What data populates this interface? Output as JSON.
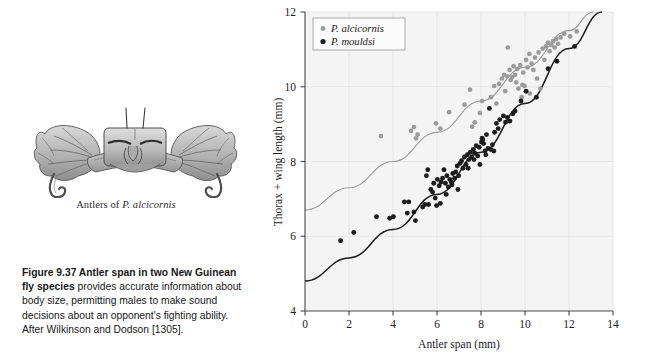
{
  "figure": {
    "caption_bold": "Figure 9.37    Antler span in two New Guinean fly species",
    "caption_rest": " provides accurate information about body size, permitting males to make sound decisions about an opponent's fighting ability. After Wilkinson and Dodson [1305]."
  },
  "illustration": {
    "name": "antler-head-drawing",
    "caption_prefix": "Antlers of ",
    "caption_species": "P. alcicornis"
  },
  "chart_data": {
    "type": "scatter",
    "title": "",
    "xlabel": "Antler span (mm)",
    "ylabel": "Thorax + wing length (mm)",
    "xlim": [
      0,
      14
    ],
    "ylim": [
      4,
      12
    ],
    "xticks": [
      0,
      2,
      4,
      6,
      8,
      10,
      12,
      14
    ],
    "yticks": [
      4,
      6,
      8,
      10,
      12
    ],
    "grid": true,
    "legend_position": "top-left",
    "colors": {
      "alcicornis": "#9b9b9b",
      "mouldsi": "#1d1d1d",
      "plot_background": "#f4f4f4",
      "gridline": "#e2e2e2",
      "axis": "#4a4a4a"
    },
    "series": [
      {
        "name": "P. alcicornis",
        "marker": "circle",
        "color": "#9b9b9b",
        "points": [
          [
            3.45,
            8.68
          ],
          [
            4.82,
            8.82
          ],
          [
            4.95,
            8.92
          ],
          [
            5.05,
            8.62
          ],
          [
            5.12,
            8.72
          ],
          [
            5.95,
            9.02
          ],
          [
            6.15,
            8.88
          ],
          [
            6.55,
            9.32
          ],
          [
            7.25,
            9.52
          ],
          [
            7.6,
            8.93
          ],
          [
            7.72,
            9.05
          ],
          [
            7.95,
            9.3
          ],
          [
            7.5,
            9.92
          ],
          [
            8.05,
            9.62
          ],
          [
            8.45,
            9.72
          ],
          [
            8.6,
            10.02
          ],
          [
            8.95,
            10.22
          ],
          [
            8.7,
            9.55
          ],
          [
            9.05,
            10.32
          ],
          [
            9.1,
            9.88
          ],
          [
            9.18,
            10.28
          ],
          [
            9.22,
            11.05
          ],
          [
            9.3,
            10.45
          ],
          [
            9.35,
            10.18
          ],
          [
            9.42,
            10.26
          ],
          [
            9.48,
            10.55
          ],
          [
            9.55,
            10.32
          ],
          [
            9.6,
            10.12
          ],
          [
            9.65,
            10.48
          ],
          [
            9.7,
            9.95
          ],
          [
            9.78,
            10.58
          ],
          [
            9.85,
            9.72
          ],
          [
            9.92,
            10.38
          ],
          [
            9.98,
            10.02
          ],
          [
            10.05,
            10.72
          ],
          [
            10.12,
            10.52
          ],
          [
            10.2,
            10.88
          ],
          [
            10.3,
            10.62
          ],
          [
            10.38,
            10.45
          ],
          [
            10.45,
            10.78
          ],
          [
            10.55,
            10.22
          ],
          [
            10.62,
            10.92
          ],
          [
            10.7,
            9.95
          ],
          [
            10.8,
            11.02
          ],
          [
            10.88,
            10.72
          ],
          [
            10.95,
            11.08
          ],
          [
            11.05,
            11.18
          ],
          [
            11.12,
            10.95
          ],
          [
            11.2,
            11.12
          ],
          [
            11.28,
            11.22
          ],
          [
            11.35,
            11.05
          ],
          [
            11.42,
            11.28
          ],
          [
            11.5,
            11.15
          ],
          [
            11.62,
            11.32
          ],
          [
            11.78,
            11.42
          ],
          [
            12.05,
            11.35
          ],
          [
            12.35,
            11.48
          ],
          [
            10.22,
            9.82
          ],
          [
            9.88,
            10.05
          ],
          [
            8.82,
            10.08
          ]
        ]
      },
      {
        "name": "P. mouldsi",
        "marker": "circle",
        "color": "#1d1d1d",
        "points": [
          [
            1.62,
            5.88
          ],
          [
            2.22,
            6.1
          ],
          [
            3.25,
            6.52
          ],
          [
            3.85,
            6.48
          ],
          [
            4.02,
            6.52
          ],
          [
            4.52,
            6.92
          ],
          [
            4.65,
            6.62
          ],
          [
            4.95,
            6.65
          ],
          [
            5.02,
            6.42
          ],
          [
            5.45,
            6.85
          ],
          [
            5.52,
            7.62
          ],
          [
            5.58,
            7.78
          ],
          [
            5.72,
            7.25
          ],
          [
            5.8,
            7.18
          ],
          [
            5.85,
            7.42
          ],
          [
            5.92,
            7.02
          ],
          [
            5.98,
            6.82
          ],
          [
            6.02,
            7.52
          ],
          [
            6.1,
            7.35
          ],
          [
            6.18,
            7.45
          ],
          [
            6.25,
            7.55
          ],
          [
            6.32,
            7.78
          ],
          [
            6.38,
            7.42
          ],
          [
            6.45,
            7.62
          ],
          [
            6.52,
            7.32
          ],
          [
            6.58,
            7.52
          ],
          [
            6.65,
            7.45
          ],
          [
            6.72,
            7.68
          ],
          [
            6.8,
            7.55
          ],
          [
            6.85,
            7.72
          ],
          [
            6.92,
            7.88
          ],
          [
            6.98,
            7.62
          ],
          [
            7.05,
            7.95
          ],
          [
            7.12,
            8.02
          ],
          [
            7.18,
            7.82
          ],
          [
            7.25,
            8.12
          ],
          [
            7.32,
            7.92
          ],
          [
            7.38,
            8.18
          ],
          [
            7.45,
            8.05
          ],
          [
            7.52,
            8.25
          ],
          [
            7.58,
            8.12
          ],
          [
            7.65,
            8.32
          ],
          [
            7.72,
            8.22
          ],
          [
            7.78,
            8.42
          ],
          [
            7.85,
            8.15
          ],
          [
            7.92,
            8.38
          ],
          [
            7.95,
            7.92
          ],
          [
            8.02,
            8.52
          ],
          [
            8.05,
            8.62
          ],
          [
            8.08,
            8.58
          ],
          [
            8.12,
            8.48
          ],
          [
            8.18,
            8.28
          ],
          [
            8.25,
            8.72
          ],
          [
            8.32,
            8.35
          ],
          [
            8.38,
            9.42
          ],
          [
            8.45,
            8.32
          ],
          [
            8.52,
            8.45
          ],
          [
            8.58,
            8.28
          ],
          [
            8.62,
            8.78
          ],
          [
            8.7,
            9.02
          ],
          [
            8.78,
            8.88
          ],
          [
            8.85,
            9.12
          ],
          [
            9.02,
            9.22
          ],
          [
            9.12,
            9.05
          ],
          [
            9.2,
            9.18
          ],
          [
            9.32,
            9.08
          ],
          [
            9.45,
            9.28
          ],
          [
            9.55,
            9.35
          ],
          [
            6.15,
            6.88
          ],
          [
            5.62,
            6.85
          ],
          [
            4.72,
            6.92
          ],
          [
            7.42,
            7.82
          ],
          [
            6.95,
            7.25
          ],
          [
            7.68,
            8.05
          ],
          [
            8.22,
            8.18
          ],
          [
            9.82,
            9.62
          ],
          [
            10.05,
            9.88
          ],
          [
            10.52,
            9.72
          ],
          [
            11.05,
            10.48
          ],
          [
            11.45,
            10.68
          ],
          [
            12.25,
            11.08
          ],
          [
            6.42,
            7.12
          ],
          [
            6.68,
            7.38
          ],
          [
            5.35,
            6.78
          ]
        ]
      }
    ],
    "fit_curves": [
      {
        "name": "P. alcicornis fit",
        "color": "#9b9b9b",
        "anchors": [
          [
            0,
            6.7
          ],
          [
            2,
            7.3
          ],
          [
            4,
            8.0
          ],
          [
            6,
            8.78
          ],
          [
            8,
            9.62
          ],
          [
            10,
            10.52
          ],
          [
            12,
            11.5
          ],
          [
            13.1,
            12.0
          ]
        ]
      },
      {
        "name": "P. mouldsi fit",
        "color": "#1d1d1d",
        "anchors": [
          [
            0,
            4.8
          ],
          [
            2,
            5.42
          ],
          [
            4,
            6.18
          ],
          [
            6,
            7.12
          ],
          [
            8,
            8.25
          ],
          [
            10,
            9.55
          ],
          [
            12,
            11.02
          ],
          [
            13.5,
            12.0
          ]
        ]
      }
    ]
  },
  "legend": {
    "entries": [
      {
        "label": "P. alcicornis",
        "color": "#9b9b9b"
      },
      {
        "label": "P. mouldsi",
        "color": "#1d1d1d"
      }
    ]
  }
}
